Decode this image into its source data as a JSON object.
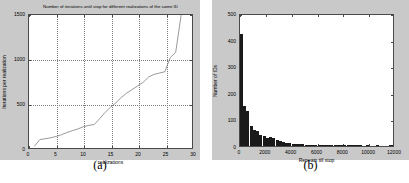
{
  "figure": {
    "background": "#ffffff",
    "panel_background": "#c9c9c9",
    "axes_background": "#ffffff",
    "axes_border_color": "#4a4a4a",
    "grid_color": "#7a7a7a",
    "line_color": "#8c8c8c",
    "bar_color": "#1a1a1a"
  },
  "panel_a": {
    "caption": "(a)",
    "title": "Number of iterations until stop for different realizations of the same ID"
  },
  "panel_b": {
    "caption": "(b)"
  },
  "chart_data": [
    {
      "id": "a",
      "type": "line",
      "title": "Number of iterations until stop for different realizations of the same ID",
      "xlabel": "realizations",
      "ylabel": "Iterations per realization",
      "xlim": [
        0,
        30
      ],
      "ylim": [
        0,
        1500
      ],
      "xticks": [
        0,
        5,
        10,
        15,
        20,
        25,
        30
      ],
      "yticks": [
        0,
        500,
        1000,
        1500
      ],
      "xticklabels": [
        "0",
        "5",
        "10",
        "15",
        "20",
        "25",
        "30"
      ],
      "yticklabels": [
        "0",
        "500",
        "1000",
        "1500"
      ],
      "grid": true,
      "legend": null,
      "x": [
        1,
        2,
        3,
        4,
        5,
        6,
        7,
        8,
        9,
        10,
        11,
        12,
        13,
        14,
        15,
        16,
        17,
        18,
        19,
        20,
        21,
        22,
        23,
        24,
        25,
        26,
        27,
        28
      ],
      "values": [
        20,
        95,
        105,
        115,
        130,
        150,
        175,
        195,
        215,
        240,
        255,
        265,
        330,
        400,
        460,
        510,
        570,
        620,
        660,
        700,
        740,
        800,
        830,
        845,
        860,
        1020,
        1080,
        1500
      ]
    },
    {
      "id": "b",
      "type": "bar",
      "title": "",
      "xlabel": "Repeats till stop",
      "ylabel": "Number of IDs",
      "xlim": [
        0,
        12000
      ],
      "ylim": [
        0,
        500
      ],
      "xticks": [
        0,
        2000,
        4000,
        6000,
        8000,
        10000,
        12000
      ],
      "yticks": [
        0,
        100,
        200,
        300,
        400,
        500
      ],
      "xticklabels": [
        "0",
        "2000",
        "4000",
        "6000",
        "8000",
        "10000",
        "12000"
      ],
      "yticklabels": [
        "0",
        "100",
        "200",
        "300",
        "400",
        "500"
      ],
      "grid": false,
      "legend": null,
      "bin_width": 250,
      "bin_starts": [
        0,
        250,
        500,
        750,
        1000,
        1250,
        1500,
        1750,
        2000,
        2250,
        2500,
        2750,
        3000,
        3250,
        3500,
        3750,
        4000,
        4250,
        4500,
        4750,
        5000,
        5250,
        5500,
        5750,
        6000,
        6250,
        6500,
        6750,
        7000,
        7250,
        7500,
        7750,
        8000,
        8250,
        8500,
        8750,
        9000,
        9250,
        9500,
        9750,
        10000,
        10250,
        10500,
        10750,
        11000,
        11250,
        11500,
        11750
      ],
      "values": [
        420,
        150,
        130,
        75,
        62,
        55,
        40,
        38,
        30,
        33,
        30,
        22,
        18,
        15,
        12,
        10,
        9,
        8,
        7,
        6,
        5,
        5,
        4,
        3,
        3,
        2,
        2,
        4,
        4,
        3,
        2,
        1,
        1,
        2,
        1,
        1,
        1,
        1,
        0,
        1,
        0,
        0,
        1,
        0,
        0,
        0,
        2,
        1
      ]
    }
  ]
}
